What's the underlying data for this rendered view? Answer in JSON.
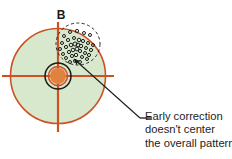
{
  "figure": {
    "panel_label": "B",
    "type": "target-scatter-diagram",
    "background_color": "#ffffff"
  },
  "target": {
    "name": "shooting-target",
    "center_x": 58,
    "center_y": 76,
    "outer_radius": 48,
    "face_fill_color": "#d7e8cd",
    "ring_color": "#cf5024",
    "crosshair_color": "#cf5024",
    "bullseye": {
      "outer_ring_radius": 13,
      "outer_ring_color": "#1a1a1a",
      "inner_ring_radius": 9.5,
      "inner_ring_color": "#cf5024",
      "core_radius": 8,
      "core_fill_color": "#e08140"
    },
    "crosshair": {
      "horizontal_from_x": 2,
      "horizontal_to_x": 114,
      "vertical_from_y": 22,
      "vertical_to_y": 132
    }
  },
  "group_marker": {
    "name": "dashed-group-circle",
    "center_x": 78,
    "center_y": 44,
    "radius_x": 22,
    "radius_y": 21,
    "stroke_color": "#2b2b2b",
    "dash_pattern": "3 2.5"
  },
  "shot_pattern": {
    "name": "shot-impact-points",
    "marker_color": "#1c1c1c",
    "marker_style": "open-circle",
    "points": [
      {
        "x": 64,
        "y": 36,
        "r": 1.5
      },
      {
        "x": 70,
        "y": 32,
        "r": 1.5
      },
      {
        "x": 77,
        "y": 31,
        "r": 1.6
      },
      {
        "x": 84,
        "y": 33,
        "r": 1.5
      },
      {
        "x": 90,
        "y": 35,
        "r": 1.5
      },
      {
        "x": 62,
        "y": 43,
        "r": 1.5
      },
      {
        "x": 68,
        "y": 40,
        "r": 1.6
      },
      {
        "x": 74,
        "y": 38,
        "r": 1.5
      },
      {
        "x": 79,
        "y": 40,
        "r": 1.8
      },
      {
        "x": 83,
        "y": 41,
        "r": 1.6
      },
      {
        "x": 88,
        "y": 43,
        "r": 1.5
      },
      {
        "x": 93,
        "y": 45,
        "r": 1.5
      },
      {
        "x": 60,
        "y": 49,
        "r": 1.5
      },
      {
        "x": 66,
        "y": 47,
        "r": 1.6
      },
      {
        "x": 71,
        "y": 45,
        "r": 1.8
      },
      {
        "x": 75,
        "y": 44,
        "r": 2.0
      },
      {
        "x": 78,
        "y": 45,
        "r": 1.9
      },
      {
        "x": 81,
        "y": 46,
        "r": 1.7
      },
      {
        "x": 86,
        "y": 48,
        "r": 1.5
      },
      {
        "x": 91,
        "y": 50,
        "r": 1.6
      },
      {
        "x": 63,
        "y": 54,
        "r": 1.5
      },
      {
        "x": 69,
        "y": 52,
        "r": 1.6
      },
      {
        "x": 73,
        "y": 50,
        "r": 1.8
      },
      {
        "x": 77,
        "y": 49,
        "r": 1.9
      },
      {
        "x": 80,
        "y": 51,
        "r": 1.6
      },
      {
        "x": 85,
        "y": 53,
        "r": 1.5
      },
      {
        "x": 89,
        "y": 55,
        "r": 1.6
      },
      {
        "x": 66,
        "y": 58,
        "r": 1.5
      },
      {
        "x": 72,
        "y": 56,
        "r": 1.6
      },
      {
        "x": 76,
        "y": 55,
        "r": 1.7
      },
      {
        "x": 82,
        "y": 57,
        "r": 1.5
      },
      {
        "x": 87,
        "y": 59,
        "r": 1.5
      },
      {
        "x": 70,
        "y": 62,
        "r": 1.5
      },
      {
        "x": 75,
        "y": 61,
        "r": 1.5
      },
      {
        "x": 80,
        "y": 62,
        "r": 1.5
      }
    ]
  },
  "leader": {
    "name": "callout-leader",
    "stroke_color": "#1a1a1a",
    "arrow_tip_x": 74,
    "arrow_tip_y": 59,
    "elbow_x": 140,
    "elbow_y": 118,
    "dash_to_x": 152,
    "dash_to_y": 118
  },
  "callout": {
    "name": "callout-text",
    "lines": [
      "Early correction",
      "doesn't center",
      "the overall pattern"
    ],
    "text_color": "#1d1d1d"
  }
}
